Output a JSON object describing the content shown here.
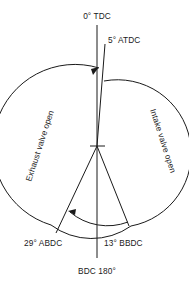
{
  "diagram": {
    "kind": "engine-valve-timing-diagram",
    "background_color": "#ffffff",
    "line_color": "#1a1a1a",
    "labels": {
      "tdc": "0° TDC",
      "atdc": "5° ATDC",
      "bdc": "BDC 180°",
      "abdc": "29° ABDC",
      "bbdc": "13° BBDC",
      "exhaust": "Exhaust valve open",
      "intake": "Intake valve open"
    },
    "geometry": {
      "center_x": 97,
      "center_y": 146,
      "radius": 68,
      "tdc_angle_deg": 0,
      "atdc_angle_deg": 5,
      "bdc_angle_deg": 180,
      "abdc_angle_deg": 29,
      "bbdc_angle_deg": 13
    },
    "icons": {
      "exhaust_arrow": "arrow-up-icon",
      "intake_arc": "arc-icon",
      "abdc_arrow": "arrow-left-icon",
      "center_mark": "center-cross-icon"
    }
  }
}
